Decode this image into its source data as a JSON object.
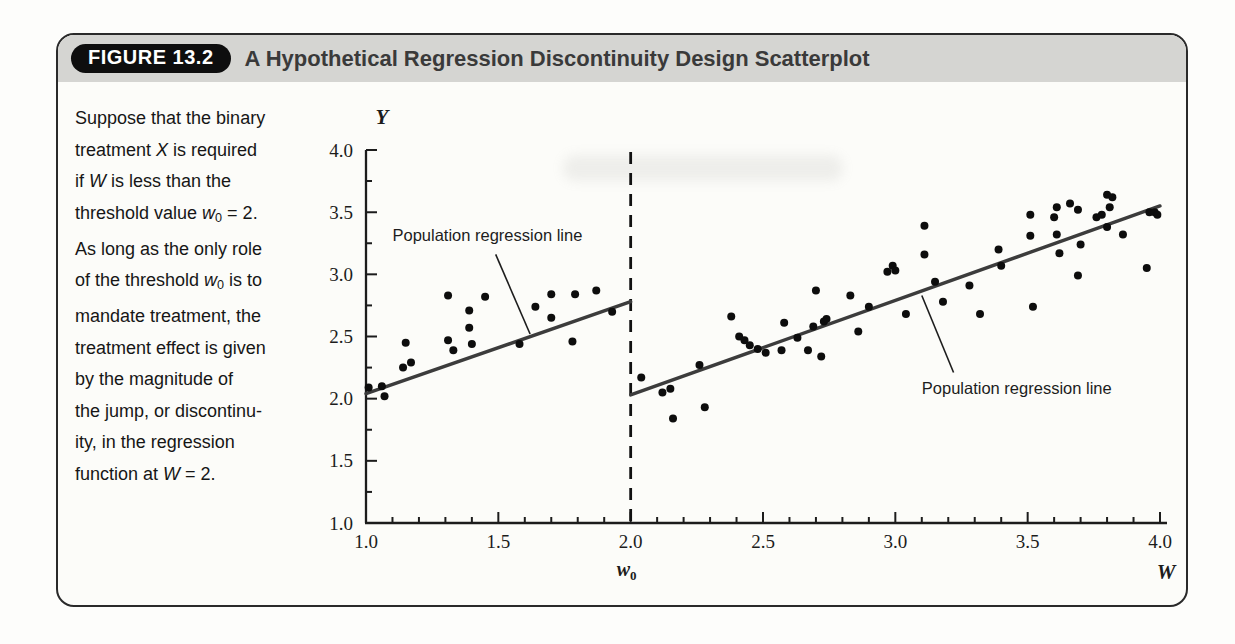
{
  "figure": {
    "badge": "FIGURE 13.2",
    "title": "A Hypothetical Regression Discontinuity Design Scatterplot",
    "caption_segments": [
      {
        "t": "Suppose that the binary\ntreatment "
      },
      {
        "t": "X",
        "s": "i"
      },
      {
        "t": " is required\nif "
      },
      {
        "t": "W",
        "s": "i"
      },
      {
        "t": " is less than the\nthreshold value "
      },
      {
        "t": "w",
        "s": "i"
      },
      {
        "t": "0",
        "s": "sub"
      },
      {
        "t": " = 2.\nAs long as the only role\nof the threshold "
      },
      {
        "t": "w",
        "s": "i"
      },
      {
        "t": "0",
        "s": "sub"
      },
      {
        "t": " is to\nmandate treatment, the\ntreatment effect is given\nby the magnitude of\nthe jump, or discontinu-\nity, in the regression\nfunction at "
      },
      {
        "t": "W",
        "s": "i"
      },
      {
        "t": " = 2."
      }
    ]
  },
  "colors": {
    "axis": "#1c1c1c",
    "point": "#0d0d0d",
    "regression_line": "#3c3c3c",
    "threshold_line": "#111111",
    "annotation_text": "#1d1d1d",
    "header_band": "#d5d5d2",
    "badge_bg": "#0e0e0e",
    "badge_text": "#ffffff"
  },
  "chart_data": {
    "type": "scatter",
    "xlabel": "W",
    "ylabel": "Y",
    "threshold": {
      "value": 2.0,
      "label_base": "w",
      "label_sub": "0"
    },
    "xlim": [
      1.0,
      4.0
    ],
    "ylim": [
      1.0,
      4.0
    ],
    "x_tick_values": [
      1.0,
      1.5,
      2.0,
      2.5,
      3.0,
      3.5,
      4.0
    ],
    "x_tick_labels": [
      "1.0",
      "1.5",
      "2.0",
      "2.5",
      "3.0",
      "3.5",
      "4.0"
    ],
    "x_minor_step": 0.1,
    "y_tick_values": [
      1.0,
      1.5,
      2.0,
      2.5,
      3.0,
      3.5,
      4.0
    ],
    "y_tick_labels": [
      "1.0",
      "1.5",
      "2.0",
      "2.5",
      "3.0",
      "3.5",
      "4.0"
    ],
    "y_minor_step": 0.25,
    "grid": false,
    "series": [
      {
        "name": "left_of_threshold",
        "points": [
          [
            1.01,
            2.09
          ],
          [
            1.06,
            2.1
          ],
          [
            1.07,
            2.02
          ],
          [
            1.14,
            2.25
          ],
          [
            1.15,
            2.45
          ],
          [
            1.17,
            2.29
          ],
          [
            1.31,
            2.83
          ],
          [
            1.31,
            2.47
          ],
          [
            1.33,
            2.39
          ],
          [
            1.39,
            2.71
          ],
          [
            1.39,
            2.57
          ],
          [
            1.4,
            2.44
          ],
          [
            1.45,
            2.82
          ],
          [
            1.58,
            2.44
          ],
          [
            1.64,
            2.74
          ],
          [
            1.7,
            2.84
          ],
          [
            1.7,
            2.65
          ],
          [
            1.78,
            2.46
          ],
          [
            1.79,
            2.84
          ],
          [
            1.87,
            2.87
          ],
          [
            1.93,
            2.7
          ]
        ]
      },
      {
        "name": "right_of_threshold",
        "points": [
          [
            2.04,
            2.17
          ],
          [
            2.12,
            2.05
          ],
          [
            2.15,
            2.08
          ],
          [
            2.16,
            1.84
          ],
          [
            2.26,
            2.27
          ],
          [
            2.28,
            1.93
          ],
          [
            2.38,
            2.66
          ],
          [
            2.41,
            2.5
          ],
          [
            2.43,
            2.47
          ],
          [
            2.45,
            2.43
          ],
          [
            2.48,
            2.4
          ],
          [
            2.51,
            2.37
          ],
          [
            2.57,
            2.39
          ],
          [
            2.58,
            2.61
          ],
          [
            2.63,
            2.49
          ],
          [
            2.67,
            2.39
          ],
          [
            2.69,
            2.58
          ],
          [
            2.7,
            2.87
          ],
          [
            2.72,
            2.34
          ],
          [
            2.73,
            2.62
          ],
          [
            2.74,
            2.64
          ],
          [
            2.83,
            2.83
          ],
          [
            2.86,
            2.54
          ],
          [
            2.9,
            2.74
          ],
          [
            2.97,
            3.02
          ],
          [
            2.99,
            3.07
          ],
          [
            3.0,
            3.03
          ],
          [
            3.04,
            2.68
          ],
          [
            3.11,
            3.39
          ],
          [
            3.11,
            3.16
          ],
          [
            3.15,
            2.94
          ],
          [
            3.18,
            2.78
          ],
          [
            3.28,
            2.91
          ],
          [
            3.32,
            2.68
          ],
          [
            3.39,
            3.2
          ],
          [
            3.4,
            3.07
          ],
          [
            3.51,
            3.48
          ],
          [
            3.51,
            3.31
          ],
          [
            3.52,
            2.74
          ],
          [
            3.6,
            3.46
          ],
          [
            3.61,
            3.54
          ],
          [
            3.61,
            3.32
          ],
          [
            3.62,
            3.17
          ],
          [
            3.66,
            3.57
          ],
          [
            3.69,
            3.52
          ],
          [
            3.69,
            2.99
          ],
          [
            3.7,
            3.24
          ],
          [
            3.76,
            3.46
          ],
          [
            3.78,
            3.48
          ],
          [
            3.8,
            3.64
          ],
          [
            3.8,
            3.38
          ],
          [
            3.81,
            3.54
          ],
          [
            3.82,
            3.62
          ],
          [
            3.86,
            3.32
          ],
          [
            3.95,
            3.05
          ],
          [
            3.96,
            3.5
          ],
          [
            3.98,
            3.5
          ],
          [
            3.99,
            3.48
          ]
        ]
      }
    ],
    "regression_lines": [
      {
        "name": "left_segment",
        "x": [
          1.0,
          2.0
        ],
        "y": [
          2.04,
          2.78
        ]
      },
      {
        "name": "right_segment",
        "x": [
          2.0,
          4.0
        ],
        "y": [
          2.03,
          3.55
        ]
      }
    ],
    "annotations": [
      {
        "text": "Population regression line",
        "text_anchor": {
          "w": 1.1,
          "y": 3.27
        },
        "pointer_from": {
          "w": 1.49,
          "y": 3.16
        },
        "pointer_to": {
          "w": 1.62,
          "y": 2.52
        }
      },
      {
        "text": "Population regression line",
        "text_anchor": {
          "w": 3.1,
          "y": 2.04
        },
        "pointer_from": {
          "w": 3.1,
          "y": 2.83
        },
        "pointer_to": {
          "w": 3.22,
          "y": 2.21
        }
      }
    ]
  }
}
